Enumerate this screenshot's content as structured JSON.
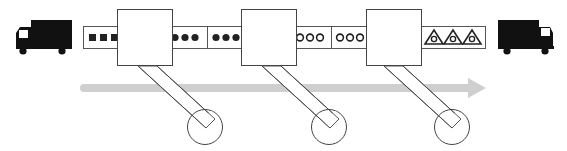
{
  "diagram": {
    "colors": {
      "ink": "#222222",
      "truck": "#111111",
      "window": "#ffffff",
      "arrow": "#cfcfcf",
      "outline": "#555555",
      "background": "#ffffff"
    },
    "trucks": [
      {
        "id": "input-truck",
        "facing": "left"
      },
      {
        "id": "output-truck",
        "facing": "right"
      }
    ],
    "conveyor": {
      "segments": [
        {
          "id": "raw",
          "item_shape": "filled-square",
          "count": 3
        },
        {
          "id": "stage1a",
          "item_shape": "filled-circle",
          "count": 3
        },
        {
          "id": "stage1b",
          "item_shape": "filled-circle",
          "count": 3
        },
        {
          "id": "stage2a",
          "item_shape": "hollow-circle",
          "count": 3
        },
        {
          "id": "stage2b",
          "item_shape": "hollow-circle",
          "count": 3
        },
        {
          "id": "finished",
          "item_shape": "triangle-with-circle",
          "count": 3
        }
      ]
    },
    "stations": [
      {
        "id": "station-1"
      },
      {
        "id": "station-2"
      },
      {
        "id": "station-3"
      }
    ],
    "flow_arrow": {
      "direction": "right"
    }
  }
}
